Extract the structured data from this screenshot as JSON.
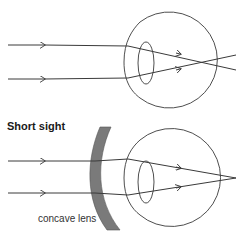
{
  "diagram": {
    "top_panel": {
      "description": "Short-sighted eye without correction: parallel rays focus in front of retina and diverge",
      "ray_count": 2
    },
    "bottom_panel": {
      "title": "Short sight",
      "lens_label": "concave lens",
      "description": "Concave lens diverges rays so they focus on the retina",
      "ray_count": 2
    },
    "colors": {
      "line": "#3a3a3a",
      "lens_fill": "#7a7a7a",
      "text": "#1a1a1a",
      "background": "#ffffff"
    }
  }
}
